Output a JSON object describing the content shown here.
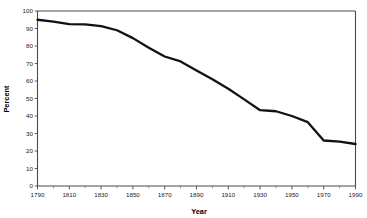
{
  "chart_data": {
    "type": "line",
    "title": "",
    "xlabel": "Year",
    "ylabel": "Percent",
    "xlim": [
      1790,
      1990
    ],
    "ylim": [
      0,
      100
    ],
    "grid": false,
    "legend": null,
    "x_tick_labels": [
      "1790",
      "1810",
      "1830",
      "1850",
      "1870",
      "1890",
      "1910",
      "1930",
      "1950",
      "1970",
      "1990"
    ],
    "x_ticks": [
      1790,
      1810,
      1830,
      1850,
      1870,
      1890,
      1910,
      1930,
      1950,
      1970,
      1990
    ],
    "x_minor_tick_step": 10,
    "y_tick_labels": [
      "0",
      "10",
      "20",
      "30",
      "40",
      "50",
      "60",
      "70",
      "80",
      "90",
      "100"
    ],
    "y_ticks": [
      0,
      10,
      20,
      30,
      40,
      50,
      60,
      70,
      80,
      90,
      100
    ],
    "x": [
      1790,
      1800,
      1810,
      1820,
      1830,
      1840,
      1850,
      1860,
      1870,
      1880,
      1890,
      1900,
      1910,
      1920,
      1930,
      1940,
      1950,
      1960,
      1970,
      1980,
      1990
    ],
    "series": [
      {
        "name": "Percent",
        "color": "#111111",
        "values": [
          95.0,
          93.9,
          92.5,
          92.4,
          91.3,
          89.0,
          84.5,
          79.0,
          74.0,
          71.2,
          66.0,
          61.0,
          55.6,
          49.5,
          43.3,
          42.7,
          40.0,
          36.5,
          26.0,
          25.3,
          24.0
        ]
      }
    ]
  },
  "axes": {
    "y_title": "Percent",
    "x_title": "Year"
  },
  "colors": {
    "line": "#111111",
    "axis": "#4a4a4a",
    "text": "#1a1a1a",
    "background": "#ffffff"
  }
}
